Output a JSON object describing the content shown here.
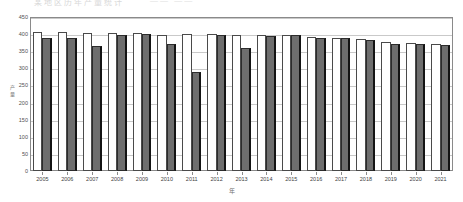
{
  "title": "某地区历年产量统计",
  "legend_strip": "——  ——",
  "axis": {
    "ylabel": "产\n量",
    "xlabel": "年"
  },
  "chart_data": {
    "type": "bar",
    "title": "某地区历年产量统计",
    "xlabel": "年",
    "ylabel": "产量",
    "ylim": [
      0,
      450
    ],
    "yticks": [
      0,
      50,
      100,
      150,
      200,
      250,
      300,
      350,
      400,
      450
    ],
    "grid": true,
    "legend_position": "top",
    "categories": [
      "2005",
      "2006",
      "2007",
      "2008",
      "2009",
      "2010",
      "2011",
      "2012",
      "2013",
      "2014",
      "2015",
      "2016",
      "2017",
      "2018",
      "2019",
      "2020",
      "2021"
    ],
    "series": [
      {
        "name": "系列1",
        "color": "#ffffff",
        "edge_color": "#4a4a4a",
        "values": [
          405,
          405,
          403,
          403,
          402,
          398,
          400,
          400,
          398,
          398,
          397,
          392,
          390,
          385,
          378,
          374,
          372
        ]
      },
      {
        "name": "系列2",
        "color": "#6e6e6e",
        "edge_color": "#2c2c2c",
        "values": [
          388,
          388,
          364,
          397,
          401,
          371,
          289,
          396,
          360,
          394,
          396,
          390,
          388,
          382,
          372,
          370,
          369
        ]
      }
    ]
  },
  "colors": {
    "series_white": "#ffffff",
    "series_gray": "#6e6e6e",
    "grid": "#c9c9c9",
    "frame": "#8a8a8a",
    "text": "#3f3f3f"
  }
}
